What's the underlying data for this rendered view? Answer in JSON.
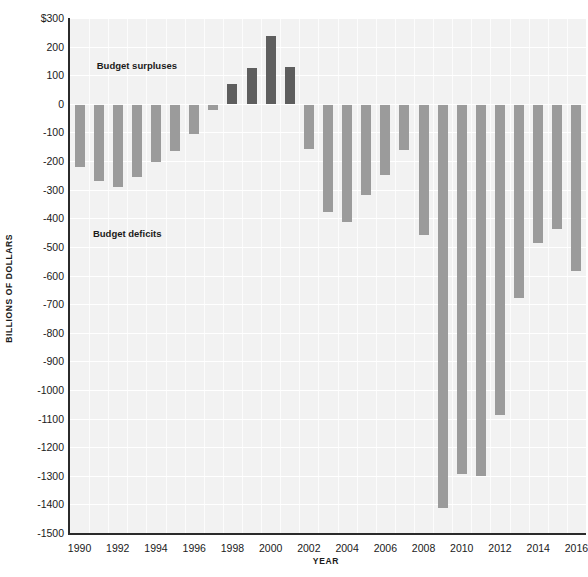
{
  "chart_data": {
    "type": "bar",
    "title": "",
    "xlabel": "YEAR",
    "ylabel": "BILLIONS OF DOLLARS",
    "ylim": [
      -1500,
      300
    ],
    "ytick_step": 100,
    "grid": true,
    "legend_position": "none",
    "categories": [
      1990,
      1991,
      1992,
      1993,
      1994,
      1995,
      1996,
      1997,
      1998,
      1999,
      2000,
      2001,
      2002,
      2003,
      2004,
      2005,
      2006,
      2007,
      2008,
      2009,
      2010,
      2011,
      2012,
      2013,
      2014,
      2015,
      2016
    ],
    "values": [
      -221,
      -269,
      -290,
      -255,
      -203,
      -164,
      -107,
      -22,
      69,
      126,
      236,
      128,
      -158,
      -378,
      -413,
      -318,
      -248,
      -161,
      -459,
      -1413,
      -1294,
      -1300,
      -1087,
      -680,
      -485,
      -438,
      -585
    ],
    "ytick_labels": [
      "$300",
      "200",
      "100",
      "0",
      "-100",
      "-200",
      "-300",
      "-400",
      "-500",
      "-600",
      "-700",
      "-800",
      "-900",
      "-1000",
      "-1100",
      "-1200",
      "-1300",
      "-1400",
      "-1500"
    ],
    "ytick_values": [
      300,
      200,
      100,
      0,
      -100,
      -200,
      -300,
      -400,
      -500,
      -600,
      -700,
      -800,
      -900,
      -1000,
      -1100,
      -1200,
      -1300,
      -1400,
      -1500
    ],
    "xtick_labels": [
      "1990",
      "1992",
      "1994",
      "1996",
      "1998",
      "2000",
      "2002",
      "2004",
      "2006",
      "2008",
      "2010",
      "2012",
      "2014",
      "2016"
    ],
    "xtick_values": [
      1990,
      1992,
      1994,
      1996,
      1998,
      2000,
      2002,
      2004,
      2006,
      2008,
      2010,
      2012,
      2014,
      2016
    ],
    "annotations": [
      {
        "text": "Budget surpluses",
        "x_year": 1991.4,
        "y_value": 133
      },
      {
        "text": "Budget deficits",
        "x_year": 1991.2,
        "y_value": -455
      }
    ],
    "colors": {
      "deficit_bar": "#9b9b9b",
      "surplus_bar": "#5e5e5e",
      "plot_background": "#f2f2f2",
      "gridline": "#ffffff",
      "axis_line": "#2b2b2b",
      "text": "#1a1a1a"
    }
  }
}
